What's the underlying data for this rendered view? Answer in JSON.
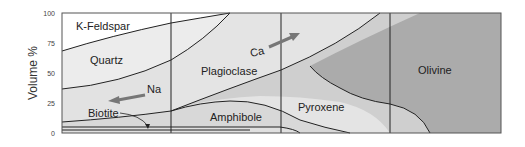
{
  "diagram": {
    "y_axis": {
      "label": "Volume %",
      "ticks": [
        "100",
        "75",
        "50",
        "25",
        "0"
      ]
    },
    "regions": [
      {
        "name": "K-Feldspar",
        "label": "K-Feldspar"
      },
      {
        "name": "Quartz",
        "label": "Quartz"
      },
      {
        "name": "Plagioclase",
        "label": "Plagioclase"
      },
      {
        "name": "Biotite",
        "label": "Biotite"
      },
      {
        "name": "Amphibole",
        "label": "Amphibole"
      },
      {
        "name": "Pyroxene",
        "label": "Pyroxene"
      },
      {
        "name": "Olivine",
        "label": "Olivine"
      }
    ],
    "arrows": [
      {
        "label": "Na",
        "direction": "left"
      },
      {
        "label": "Ca",
        "direction": "right"
      }
    ],
    "colors": {
      "k_feldspar": "#ffffff",
      "quartz": "#ececec",
      "plagioclase": "#e4e4e4",
      "biotite": "#e0e0e0",
      "amphibole": "#d6d6d6",
      "pyroxene": "#cdcdcd",
      "olivine": "#a9a9a9",
      "line": "#222222",
      "arrow": "#777777"
    }
  }
}
